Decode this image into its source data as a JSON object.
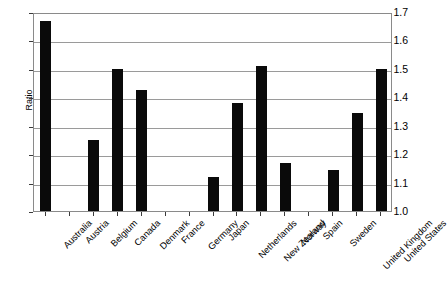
{
  "chart_data": {
    "type": "bar",
    "title": "",
    "subtitle": "",
    "xlabel": "",
    "ylabel": "Ratio",
    "ylim": [
      1.0,
      1.7
    ],
    "ytick_step": 0.1,
    "yticks": [
      "1.0",
      "1.1",
      "1.2",
      "1.3",
      "1.4",
      "1.5",
      "1.6",
      "1.7"
    ],
    "grid": true,
    "legend": false,
    "bar_color": "#0a0a0a",
    "categories": [
      "Australia",
      "Austria",
      "Belgium",
      "Canada",
      "Denmark",
      "France",
      "Germany",
      "Japan",
      "Netherlands",
      "New Zealand",
      "Norway",
      "Spain",
      "Sweden",
      "United Kingdom",
      "United States"
    ],
    "values": [
      1.67,
      null,
      1.25,
      1.5,
      1.425,
      null,
      null,
      1.12,
      1.38,
      1.51,
      1.17,
      null,
      1.145,
      1.345,
      1.5
    ]
  }
}
